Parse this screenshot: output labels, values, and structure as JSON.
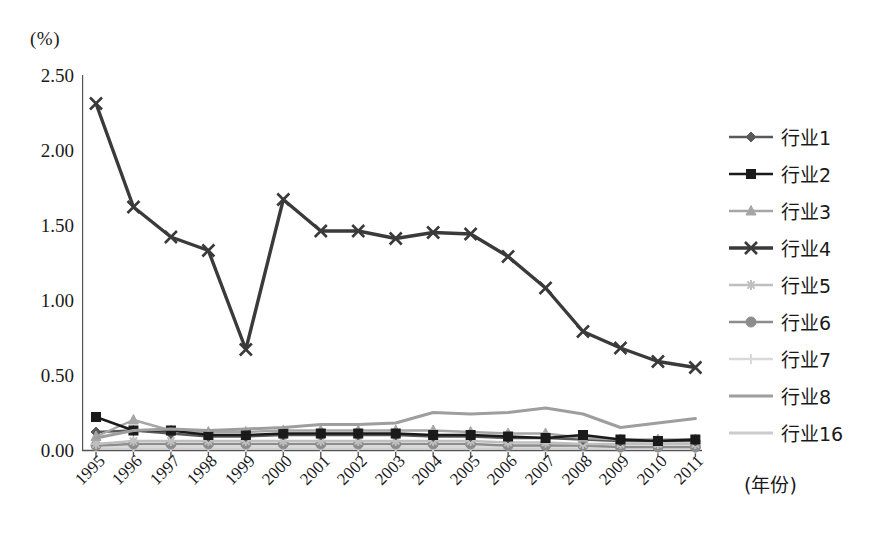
{
  "axes": {
    "unit_label": "(%)",
    "xaxis_title": "(年份)",
    "ytick_labels": [
      "2.50",
      "2.00",
      "1.50",
      "1.00",
      "0.50",
      "0.00"
    ]
  },
  "legend": {
    "items": [
      {
        "label": "行业1",
        "marker": "diamond-marker",
        "color": "#595959"
      },
      {
        "label": "行业2",
        "marker": "square-marker",
        "color": "#1a1a1a"
      },
      {
        "label": "行业3",
        "marker": "triangle-marker",
        "color": "#a6a6a6"
      },
      {
        "label": "行业4",
        "marker": "cross-marker",
        "color": "#3a3a3a"
      },
      {
        "label": "行业5",
        "marker": "star-marker",
        "color": "#bfbfbf"
      },
      {
        "label": "行业6",
        "marker": "circle-marker",
        "color": "#8c8c8c"
      },
      {
        "label": "行业7",
        "marker": "plus-marker",
        "color": "#d9d9d9"
      },
      {
        "label": "行业8",
        "marker": "line-marker",
        "color": "#9e9e9e"
      },
      {
        "label": "行业16",
        "marker": "line-marker",
        "color": "#cccccc"
      }
    ]
  },
  "chart_data": {
    "type": "line",
    "title": "",
    "xlabel": "(年份)",
    "ylabel": "(%)",
    "ylim": [
      0.0,
      2.5
    ],
    "ytick_values": [
      0.0,
      0.5,
      1.0,
      1.5,
      2.0,
      2.5
    ],
    "grid": false,
    "legend_position": "right",
    "categories": [
      "1995",
      "1996",
      "1997",
      "1998",
      "1999",
      "2000",
      "2001",
      "2002",
      "2003",
      "2004",
      "2005",
      "2006",
      "2007",
      "2008",
      "2009",
      "2010",
      "2011"
    ],
    "series": [
      {
        "name": "行业1",
        "marker": "diamond",
        "color": "#595959",
        "values": [
          0.12,
          0.13,
          0.11,
          0.09,
          0.09,
          0.1,
          0.1,
          0.1,
          0.1,
          0.09,
          0.09,
          0.08,
          0.08,
          0.07,
          0.06,
          0.06,
          0.06
        ]
      },
      {
        "name": "行业2",
        "marker": "square",
        "color": "#1a1a1a",
        "values": [
          0.22,
          0.13,
          0.13,
          0.1,
          0.1,
          0.11,
          0.11,
          0.11,
          0.11,
          0.1,
          0.1,
          0.09,
          0.08,
          0.1,
          0.07,
          0.06,
          0.07
        ]
      },
      {
        "name": "行业3",
        "marker": "triangle",
        "color": "#a6a6a6",
        "values": [
          0.09,
          0.2,
          0.13,
          0.12,
          0.12,
          0.13,
          0.13,
          0.13,
          0.13,
          0.13,
          0.12,
          0.11,
          0.11,
          0.08,
          0.07,
          0.07,
          0.07
        ]
      },
      {
        "name": "行业4",
        "marker": "cross",
        "color": "#3a3a3a",
        "values": [
          2.31,
          1.62,
          1.42,
          1.33,
          0.67,
          1.67,
          1.46,
          1.46,
          1.41,
          1.45,
          1.44,
          1.29,
          1.08,
          0.79,
          0.68,
          0.59,
          0.55
        ]
      },
      {
        "name": "行业5",
        "marker": "star",
        "color": "#bfbfbf",
        "values": [
          0.04,
          0.06,
          0.06,
          0.06,
          0.06,
          0.06,
          0.06,
          0.06,
          0.06,
          0.06,
          0.06,
          0.05,
          0.05,
          0.04,
          0.04,
          0.04,
          0.04
        ]
      },
      {
        "name": "行业6",
        "marker": "circle",
        "color": "#8c8c8c",
        "values": [
          0.03,
          0.04,
          0.04,
          0.04,
          0.04,
          0.04,
          0.04,
          0.04,
          0.04,
          0.04,
          0.04,
          0.03,
          0.03,
          0.03,
          0.02,
          0.02,
          0.02
        ]
      },
      {
        "name": "行业7",
        "marker": "plus",
        "color": "#d9d9d9",
        "values": [
          0.02,
          0.02,
          0.02,
          0.02,
          0.02,
          0.02,
          0.02,
          0.02,
          0.02,
          0.02,
          0.02,
          0.02,
          0.02,
          0.02,
          0.01,
          0.01,
          0.01
        ]
      },
      {
        "name": "行业8",
        "marker": "none",
        "color": "#9e9e9e",
        "values": [
          0.08,
          0.13,
          0.14,
          0.13,
          0.14,
          0.15,
          0.17,
          0.17,
          0.18,
          0.25,
          0.24,
          0.25,
          0.28,
          0.24,
          0.15,
          0.18,
          0.21
        ]
      },
      {
        "name": "行业16",
        "marker": "none",
        "color": "#cccccc",
        "values": [
          0.01,
          0.01,
          0.01,
          0.01,
          0.01,
          0.01,
          0.01,
          0.01,
          0.01,
          0.01,
          0.01,
          0.01,
          0.01,
          0.01,
          0.01,
          0.01,
          0.01
        ]
      }
    ]
  }
}
